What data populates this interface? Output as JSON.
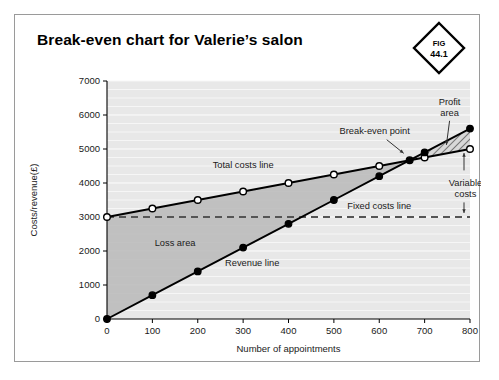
{
  "figure": {
    "title": "Break-even chart for Valerie’s salon",
    "badge_kicker": "FIG",
    "badge_number": "44.1"
  },
  "chart_data": {
    "type": "line",
    "title": "Break-even chart for Valerie’s salon",
    "xlabel": "Number of appointments",
    "ylabel": "Costs/revenue(£)",
    "xlim": [
      0,
      800
    ],
    "ylim": [
      0,
      7000
    ],
    "xticks": [
      0,
      100,
      200,
      300,
      400,
      500,
      600,
      700,
      800
    ],
    "yticks": [
      0,
      1000,
      2000,
      3000,
      4000,
      5000,
      6000,
      7000
    ],
    "xtick_labels": [
      "0",
      "100",
      "200",
      "300",
      "400",
      "500",
      "600",
      "700",
      "800"
    ],
    "ytick_labels": [
      "0",
      "1000",
      "2000",
      "3000",
      "4000",
      "5000",
      "6000",
      "7000"
    ],
    "grid": "horizontal",
    "legend": "none",
    "x": [
      0,
      100,
      200,
      300,
      400,
      500,
      600,
      700,
      800
    ],
    "series": [
      {
        "name": "Total costs line",
        "marker": "open-circle",
        "values": [
          3000,
          3250,
          3500,
          3750,
          4000,
          4250,
          4500,
          4750,
          5000
        ]
      },
      {
        "name": "Revenue line",
        "marker": "filled-circle",
        "values": [
          0,
          700,
          1400,
          2100,
          2800,
          3500,
          4200,
          4900,
          5600
        ]
      },
      {
        "name": "Fixed costs line",
        "marker": "none",
        "style": "dashed",
        "values": [
          3000,
          3000,
          3000,
          3000,
          3000,
          3000,
          3000,
          3000,
          3000
        ]
      }
    ],
    "break_even_point": {
      "x": 667,
      "y": 4667
    },
    "annotations": [
      {
        "name": "total-costs-line",
        "text": "Total costs line",
        "x": 300,
        "y": 4450
      },
      {
        "name": "revenue-line",
        "text": "Revenue line",
        "x": 320,
        "y": 1550
      },
      {
        "name": "fixed-costs-line",
        "text": "Fixed costs line",
        "x": 600,
        "y": 3250
      },
      {
        "name": "loss-area",
        "text": "Loss area",
        "x": 150,
        "y": 2150
      },
      {
        "name": "break-even-point",
        "text": "Break-even point",
        "x": 590,
        "y": 5450
      },
      {
        "name": "profit-area",
        "text": "Profit area",
        "x": 755,
        "y": 6300
      },
      {
        "name": "variable-costs",
        "text": "Variable costs",
        "x": 790,
        "y": 3900
      }
    ],
    "regions": [
      {
        "name": "loss-area",
        "fill": "solid-grey"
      },
      {
        "name": "profit-area",
        "fill": "diagonal-hatch"
      }
    ]
  }
}
